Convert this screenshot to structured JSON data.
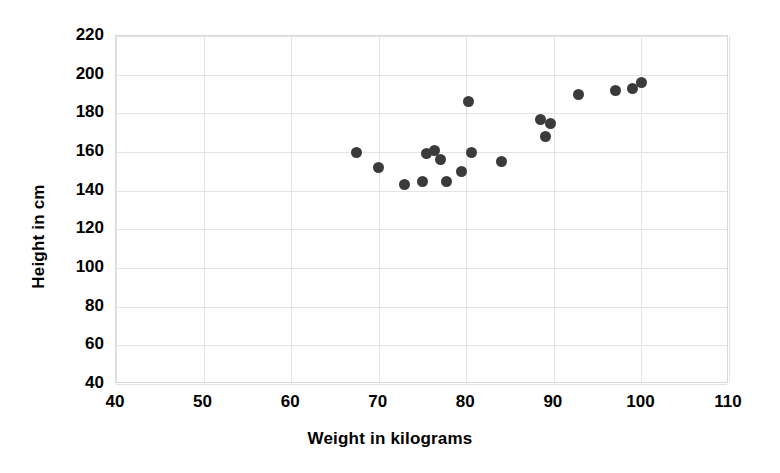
{
  "chart_data": {
    "type": "scatter",
    "title": "",
    "xlabel": "Weight in kilograms",
    "ylabel": "Height in cm",
    "xlim": [
      40,
      110
    ],
    "ylim": [
      40,
      220
    ],
    "xticks": [
      40,
      50,
      60,
      70,
      80,
      90,
      100,
      110
    ],
    "yticks": [
      40,
      60,
      80,
      100,
      120,
      140,
      160,
      180,
      200,
      220
    ],
    "xtick_labels": [
      "40",
      "50",
      "60",
      "70",
      "80",
      "90",
      "100",
      "110"
    ],
    "ytick_labels": [
      "40",
      "60",
      "80",
      "100",
      "120",
      "140",
      "160",
      "180",
      "200",
      "220"
    ],
    "grid": true,
    "grid_color": "#e4e4e4",
    "legend": false,
    "marker_color": "#3b3b3b",
    "marker_size": 11,
    "background": "#ffffff",
    "series": [
      {
        "name": "Height vs Weight",
        "points": [
          {
            "x": 67.5,
            "y": 160
          },
          {
            "x": 70.0,
            "y": 152
          },
          {
            "x": 73.0,
            "y": 143
          },
          {
            "x": 75.0,
            "y": 145
          },
          {
            "x": 75.4,
            "y": 159
          },
          {
            "x": 76.4,
            "y": 161
          },
          {
            "x": 77.0,
            "y": 156
          },
          {
            "x": 77.7,
            "y": 145
          },
          {
            "x": 79.4,
            "y": 150
          },
          {
            "x": 80.3,
            "y": 186
          },
          {
            "x": 80.6,
            "y": 160
          },
          {
            "x": 84.0,
            "y": 155
          },
          {
            "x": 88.5,
            "y": 177
          },
          {
            "x": 89.0,
            "y": 168
          },
          {
            "x": 89.6,
            "y": 175
          },
          {
            "x": 92.8,
            "y": 190
          },
          {
            "x": 97.0,
            "y": 192
          },
          {
            "x": 99.0,
            "y": 193
          },
          {
            "x": 100.0,
            "y": 196
          }
        ]
      }
    ]
  }
}
